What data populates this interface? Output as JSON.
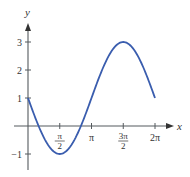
{
  "chart_data": {
    "type": "line",
    "title": "",
    "xlabel": "x",
    "ylabel": "y",
    "function": "y = 2 sin(x - π/2 ... ) approximately; y = 1 - 2 sin(x) shape",
    "xlim": [
      0,
      6.2832
    ],
    "ylim": [
      -1,
      3
    ],
    "grid": false,
    "legend": "none",
    "x_ticks": [
      {
        "value": 1.5708,
        "num": "π",
        "den": "2"
      },
      {
        "value": 3.1416,
        "label": "π"
      },
      {
        "value": 4.7124,
        "num": "3π",
        "den": "2"
      },
      {
        "value": 6.2832,
        "label": "2π"
      }
    ],
    "y_ticks": [
      {
        "value": 3,
        "label": "3"
      },
      {
        "value": 2,
        "label": "2"
      },
      {
        "value": 1,
        "label": "1"
      },
      {
        "value": -1,
        "label": "−1"
      }
    ],
    "series": [
      {
        "name": "y = 1 − 2 sin x",
        "color": "#3a5dae",
        "x": [
          0,
          0.5236,
          1.5708,
          2.618,
          3.1416,
          3.6652,
          4.7124,
          5.7596,
          6.2832
        ],
        "y": [
          1,
          0,
          -1,
          0,
          1,
          2,
          3,
          2,
          1
        ]
      }
    ]
  }
}
